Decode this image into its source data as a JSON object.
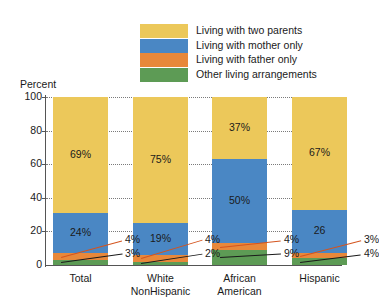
{
  "chart_data": {
    "type": "bar",
    "subtype": "stacked-100-percent",
    "title": "",
    "xlabel": "",
    "ylabel": "Percent",
    "ylim": [
      0,
      100
    ],
    "yticks": [
      "0",
      "20",
      "40",
      "60",
      "80",
      "100"
    ],
    "grid": true,
    "legend_position": "top",
    "categories": [
      "Total",
      "White NonHispanic",
      "African American",
      "Hispanic"
    ],
    "category_lines": [
      [
        "Total"
      ],
      [
        "White",
        "NonHispanic"
      ],
      [
        "African",
        "American"
      ],
      [
        "Hispanic"
      ]
    ],
    "series": [
      {
        "name": "Living with two parents",
        "color": "#ecc85a",
        "values": [
          69,
          75,
          37,
          67
        ],
        "labels": [
          "69%",
          "75%",
          "37%",
          "67%"
        ]
      },
      {
        "name": "Living with mother only",
        "color": "#4a87c4",
        "values": [
          24,
          19,
          50,
          26
        ],
        "labels": [
          "24%",
          "19%",
          "50%",
          "26"
        ]
      },
      {
        "name": "Living with father only",
        "color": "#e8883a",
        "values": [
          4,
          4,
          4,
          3
        ],
        "labels": [
          "4%",
          "4%",
          "4%",
          "3%"
        ]
      },
      {
        "name": "Other living arrangements",
        "color": "#5d9b55",
        "values": [
          3,
          2,
          9,
          4
        ],
        "labels": [
          "3%",
          "2%",
          "9%",
          "4%"
        ]
      }
    ]
  },
  "legend": {
    "items": [
      {
        "label": "Living with two parents",
        "color": "#ecc85a"
      },
      {
        "label": "Living with mother only",
        "color": "#4a87c4"
      },
      {
        "label": "Living with father only",
        "color": "#e8883a"
      },
      {
        "label": "Other living arrangements",
        "color": "#5d9b55"
      }
    ]
  },
  "axis": {
    "y_title": "Percent",
    "y_ticks": [
      "100",
      "80",
      "60",
      "40",
      "20",
      "0"
    ]
  },
  "callouts": [
    {
      "text": "4%",
      "series": "Living with father only"
    },
    {
      "text": "3%",
      "series": "Other living arrangements"
    },
    {
      "text": "4%",
      "series": "Living with father only"
    },
    {
      "text": "2%",
      "series": "Other living arrangements"
    },
    {
      "text": "4%",
      "series": "Living with father only"
    },
    {
      "text": "9%",
      "series": "Other living arrangements"
    },
    {
      "text": "3%",
      "series": "Living with father only"
    },
    {
      "text": "4%",
      "series": "Other living arrangements"
    }
  ]
}
